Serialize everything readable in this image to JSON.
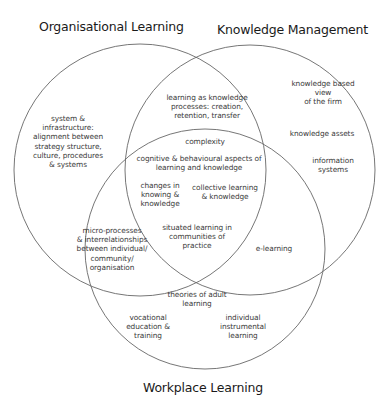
{
  "titles": {
    "organisational_learning": "Organisational Learning",
    "knowledge_management": "Knowledge Management",
    "workplace_learning": "Workplace Learning"
  },
  "regions": {
    "ol_only": "system &\ninfrastructure:\nalignment between\nstrategy structure,\nculture, procedures\n& systems",
    "ol_km": "learning as knowledge\nprocesses: creation,\nretention, transfer",
    "km_only_1": "knowledge based view\nof the firm",
    "km_only_2": "knowledge assets",
    "km_only_3": "information systems",
    "center_complexity": "complexity",
    "center_cognitive": "cognitive & behavioural aspects of\nlearning and knowledge",
    "center_changes": "changes in\nknowing &\nknowledge",
    "center_collective": "collective learning\n& knowledge",
    "center_situated": "situated learning in\ncommunities of\npractice",
    "ol_wl": "micro-processes\n& interrelationships\nbetween individual/\ncommunity/\norganisation",
    "km_wl": "e-learning",
    "wl_only_1": "theories of adult\nlearning",
    "wl_only_2": "vocational\neducation &\ntraining",
    "wl_only_3": "individual\ninstrumental\nlearning"
  },
  "colors": {
    "line": "#555555",
    "text": "#3a3a3a",
    "background": "#ffffff"
  }
}
